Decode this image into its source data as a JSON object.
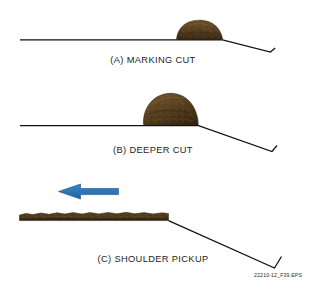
{
  "figure": {
    "title_reference": "22210-12_F39.EPS",
    "background_color": "#ffffff",
    "line_color": "#111111",
    "soil_color_dark": "#3b2a14",
    "soil_color_mid": "#5d4423",
    "soil_color_light": "#7a5c32",
    "arrow_color": "#2d74b5"
  },
  "panels": [
    {
      "id": "a",
      "label": "(A) MARKING CUT",
      "soil_name": "soil-windrow-small",
      "description_order": 1
    },
    {
      "id": "b",
      "label": "(B) DEEPER CUT",
      "soil_name": "soil-windrow-large",
      "description_order": 2
    },
    {
      "id": "c",
      "label": "(C) SHOULDER PICKUP",
      "soil_name": "soil-layer-strip",
      "description_order": 3,
      "arrow": {
        "name": "direction-arrow-left",
        "direction": "left",
        "color": "#2d74b5"
      }
    }
  ]
}
